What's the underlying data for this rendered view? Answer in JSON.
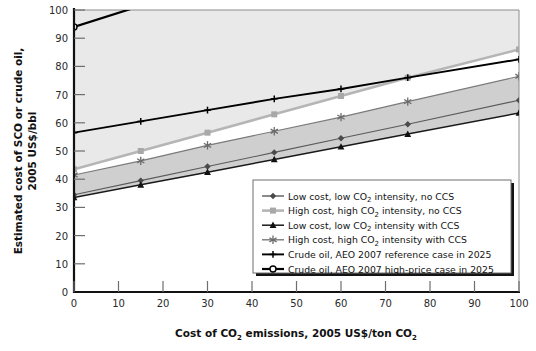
{
  "chart_data": {
    "type": "line",
    "title": "",
    "xlabel": "Cost of CO2 emissions, 2005 US$/ton CO2",
    "xlabel_parts": {
      "a": "Cost of CO",
      "sub1": "2",
      "b": " emissions, 2005 US$/ton CO",
      "sub2": "2"
    },
    "ylabel": "Estimated cost of SCO or crude oil, 2005 US$/bbl",
    "ylabel_line1": "Estimated cost of SCO or crude oil,",
    "ylabel_line2": "2005 US$/bbl",
    "xlim": [
      0,
      100
    ],
    "ylim": [
      0,
      100
    ],
    "xticks": [
      0,
      10,
      20,
      30,
      40,
      50,
      60,
      70,
      80,
      90,
      100
    ],
    "yticks": [
      0,
      10,
      20,
      30,
      40,
      50,
      60,
      70,
      80,
      90,
      100
    ],
    "xtick_labels": [
      "0",
      "10",
      "20",
      "30",
      "40",
      "50",
      "60",
      "70",
      "80",
      "90",
      "100"
    ],
    "ytick_labels": [
      "0",
      "10",
      "20",
      "30",
      "40",
      "50",
      "60",
      "70",
      "80",
      "90",
      "100"
    ],
    "grid": false,
    "legend_position": "inside-lower-right",
    "x": [
      0,
      15,
      30,
      45,
      60,
      75,
      100
    ],
    "series": [
      {
        "name": "Low cost, low CO2 intensity, no CCS",
        "label_parts": {
          "a": "Low cost, low CO",
          "sub": "2",
          "b": " intensity, no CCS"
        },
        "values": [
          34.5,
          39.5,
          44.5,
          49.5,
          54.5,
          59.5,
          68.0
        ],
        "color": "#5a5a5a",
        "marker": "diamond",
        "marker_color": "#4a4a4a",
        "width": 1.1
      },
      {
        "name": "High cost, high CO2 intensity, no CCS",
        "label_parts": {
          "a": "High cost, high CO",
          "sub": "2",
          "b": " intensity, no CCS"
        },
        "values": [
          43.5,
          50.0,
          56.5,
          63.0,
          69.5,
          76.0,
          86.0
        ],
        "color": "#b5b5b5",
        "marker": "square",
        "marker_color": "#a8a8a8",
        "width": 2.6
      },
      {
        "name": "Low cost, low CO2 intensity with CCS",
        "label_parts": {
          "a": "Low cost, low CO",
          "sub": "2",
          "b": " intensity with CCS"
        },
        "values": [
          33.5,
          38.0,
          42.5,
          47.0,
          51.5,
          56.0,
          63.5
        ],
        "color": "#1a1a1a",
        "marker": "triangle",
        "marker_color": "#111111",
        "width": 1.5
      },
      {
        "name": "High cost, high CO2 intensity with CCS",
        "label_parts": {
          "a": "High cost, high CO",
          "sub": "2",
          "b": " intensity with CCS"
        },
        "values": [
          41.5,
          46.5,
          52.0,
          57.0,
          62.0,
          67.5,
          76.5
        ],
        "color": "#7a7a7a",
        "marker": "asterisk",
        "marker_color": "#6a6a6a",
        "width": 1.1
      },
      {
        "name": "Crude oil, AEO 2007 reference case in 2025",
        "label_parts": {
          "a": "Crude oil, AEO 2007 reference case in 2025",
          "sub": "",
          "b": ""
        },
        "values": [
          56.5,
          60.5,
          64.5,
          68.5,
          72.0,
          76.0,
          82.5
        ],
        "color": "#000000",
        "marker": "plus",
        "marker_color": "#000000",
        "width": 1.9
      },
      {
        "name": "Crude oil, AEO 2007 high-price case in 2025",
        "label_parts": {
          "a": "Crude oil, AEO 2007 high-price case in 2025",
          "sub": "",
          "b": ""
        },
        "values": [
          94.0,
          101.5,
          109.0,
          116.5,
          124.0,
          131.5,
          150.0
        ],
        "color": "#000000",
        "marker": "circle-open",
        "marker_color": "#000000",
        "width": 2.2
      }
    ],
    "fills": [
      {
        "name": "upper-background-fill",
        "between": [
          1,
          "top"
        ],
        "color": "#e9e9e9"
      },
      {
        "name": "ccs-band-fill",
        "between": [
          2,
          3
        ],
        "color": "#cfcfcf"
      }
    ]
  },
  "legend": {
    "items": [
      {
        "label": "Low cost, low CO2 intensity, no CCS"
      },
      {
        "label": "High cost, high CO2 intensity, no CCS"
      },
      {
        "label": "Low cost, low CO2 intensity with CCS"
      },
      {
        "label": "High cost, high CO2 intensity with CCS"
      },
      {
        "label": "Crude oil, AEO 2007 reference case in 2025"
      },
      {
        "label": "Crude oil, AEO 2007 high-price case in 2025"
      }
    ]
  }
}
